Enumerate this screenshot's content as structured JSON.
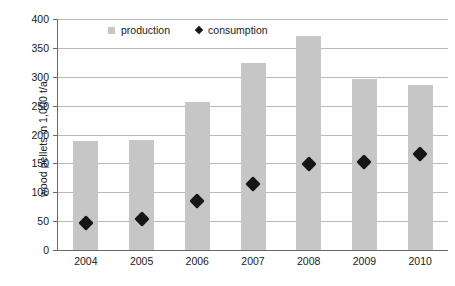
{
  "chart_data": {
    "type": "bar",
    "title": "",
    "xlabel": "",
    "ylabel": "wood pellets in 1,000 t/a",
    "categories": [
      "2004",
      "2005",
      "2006",
      "2007",
      "2008",
      "2009",
      "2010"
    ],
    "ylim": [
      0,
      400
    ],
    "yticks": [
      0,
      50,
      100,
      150,
      200,
      250,
      300,
      350,
      400
    ],
    "ytick_labels": [
      "0",
      "50",
      "100",
      "150",
      "200",
      "250",
      "300",
      "350",
      "400"
    ],
    "grid": true,
    "legend_position": "top",
    "series": [
      {
        "name": "production",
        "type": "bar",
        "color": "#c6c6c6",
        "marker": "square",
        "values": [
          189,
          190,
          257,
          324,
          370,
          296,
          286
        ]
      },
      {
        "name": "consumption",
        "type": "scatter",
        "color": "#161616",
        "marker": "diamond",
        "values": [
          46,
          53,
          85,
          115,
          149,
          153,
          166
        ]
      }
    ]
  },
  "legend": {
    "items": [
      {
        "label": "production",
        "marker": "square-marker",
        "color": "#c6c6c6"
      },
      {
        "label": "consumption",
        "marker": "diamond-marker",
        "color": "#161616"
      }
    ]
  },
  "axes": {
    "y_title": "wood pellets in 1,000 t/a"
  }
}
